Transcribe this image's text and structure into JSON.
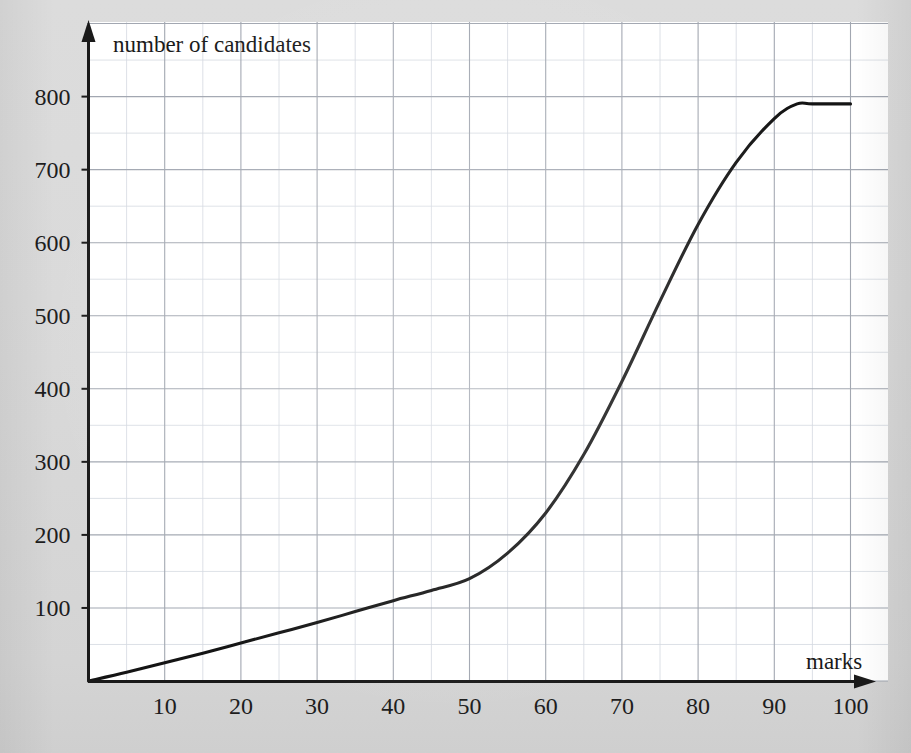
{
  "figure": {
    "background_color": "#d9d9d9",
    "panel_color": "#ffffff",
    "curve_color": "#111111",
    "axis_color": "#1a1a1a",
    "grid_major_color": "#9fa4ae",
    "grid_minor_color": "#cfd4dc"
  },
  "chart_data": {
    "type": "line",
    "title": "",
    "subtitle": "",
    "xlabel": "marks",
    "ylabel": "number of candidates",
    "xlim": [
      0,
      105
    ],
    "ylim": [
      0,
      850
    ],
    "xticks": [
      10,
      20,
      30,
      40,
      50,
      60,
      70,
      80,
      90,
      100
    ],
    "xtick_labels": [
      "10",
      "20",
      "30",
      "40",
      "50",
      "60",
      "70",
      "80",
      "90",
      "100"
    ],
    "yticks": [
      100,
      200,
      300,
      400,
      500,
      600,
      700,
      800
    ],
    "ytick_labels": [
      "100",
      "200",
      "300",
      "400",
      "500",
      "600",
      "700",
      "800"
    ],
    "x_minor_step": 5,
    "y_minor_step": 50,
    "grid": true,
    "grid_minor": true,
    "legend": "none",
    "annotations": [],
    "series": [
      {
        "name": "cumulative frequency",
        "x": [
          0,
          5,
          10,
          15,
          20,
          25,
          30,
          35,
          40,
          45,
          50,
          55,
          60,
          65,
          70,
          75,
          80,
          85,
          90,
          93,
          95,
          100
        ],
        "y": [
          0,
          12,
          25,
          38,
          52,
          66,
          80,
          95,
          110,
          124,
          140,
          175,
          230,
          310,
          410,
          520,
          625,
          710,
          770,
          790,
          790,
          790
        ]
      }
    ]
  },
  "labels": {
    "y_axis_title": "number of candidates",
    "x_axis_title": "marks"
  },
  "icons": {
    "y_axis_arrow": "arrow-up-icon",
    "x_axis_arrow": "arrow-right-icon"
  }
}
